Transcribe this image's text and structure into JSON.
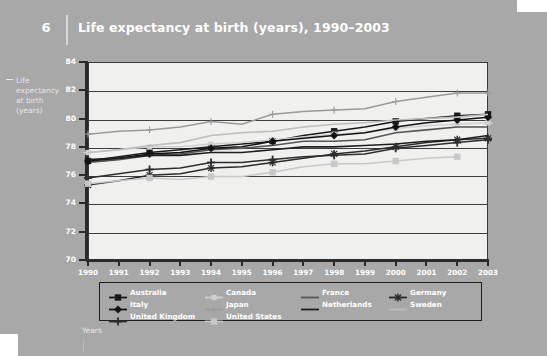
{
  "header": {
    "figure_number": "6",
    "title": "Life expectancy at birth (years), 1990–2003"
  },
  "axis_titles": {
    "y": "Life expectancy at birth (years)",
    "x": "Years"
  },
  "chart_data": {
    "type": "line",
    "title": "Life expectancy at birth (years), 1990–2003",
    "xlabel": "Years",
    "ylabel": "Life expectancy at birth (years)",
    "x": [
      1990,
      1991,
      1992,
      1993,
      1994,
      1995,
      1996,
      1997,
      1998,
      1999,
      2000,
      2001,
      2002,
      2003
    ],
    "categories": [
      "1990",
      "1991",
      "1992",
      "1993",
      "1994",
      "1995",
      "1996",
      "1997",
      "1998",
      "1999",
      "2000",
      "2001",
      "2002",
      "2003"
    ],
    "ylim": [
      70,
      84
    ],
    "yticks": [
      70,
      72,
      74,
      76,
      78,
      80,
      82,
      84
    ],
    "xlim": [
      1990,
      2003
    ],
    "grid": true,
    "legend_position": "bottom",
    "series": [
      {
        "name": "Australia",
        "color": "#1a1a1a",
        "marker": "square",
        "values": [
          77.0,
          77.3,
          77.6,
          77.8,
          78.0,
          78.2,
          78.4,
          78.8,
          79.1,
          79.4,
          79.8,
          80.0,
          80.2,
          80.3
        ]
      },
      {
        "name": "Canada",
        "color": "#d0d0d0",
        "marker": "cross-square",
        "values": [
          77.6,
          77.8,
          78.0,
          78.0,
          78.2,
          78.3,
          78.5,
          78.7,
          78.9,
          79.0,
          79.3,
          79.5,
          79.6,
          79.7
        ]
      },
      {
        "name": "France",
        "color": "#555555",
        "marker": "none",
        "values": [
          76.9,
          77.1,
          77.4,
          77.5,
          77.8,
          77.9,
          78.1,
          78.4,
          78.4,
          78.5,
          79.0,
          79.2,
          79.4,
          79.4
        ]
      },
      {
        "name": "Germany",
        "color": "#2b2b2b",
        "marker": "star",
        "values": [
          75.3,
          75.6,
          76.0,
          76.1,
          76.5,
          76.6,
          76.9,
          77.2,
          77.5,
          77.7,
          78.0,
          78.3,
          78.5,
          78.6
        ]
      },
      {
        "name": "Italy",
        "color": "#121212",
        "marker": "diamond",
        "values": [
          77.0,
          77.2,
          77.5,
          77.6,
          77.9,
          78.0,
          78.4,
          78.6,
          78.8,
          79.0,
          79.4,
          79.7,
          79.9,
          80.1
        ]
      },
      {
        "name": "Japan",
        "color": "#9a9a9a",
        "marker": "plus",
        "values": [
          78.9,
          79.1,
          79.2,
          79.4,
          79.8,
          79.6,
          80.3,
          80.5,
          80.6,
          80.7,
          81.2,
          81.5,
          81.8,
          81.8
        ]
      },
      {
        "name": "Netherlands",
        "color": "#1f1f1f",
        "marker": "none",
        "values": [
          77.1,
          77.2,
          77.4,
          77.4,
          77.6,
          77.6,
          77.8,
          78.0,
          78.0,
          78.1,
          78.2,
          78.4,
          78.5,
          78.8
        ]
      },
      {
        "name": "Sweden",
        "color": "#bdbdbd",
        "marker": "none",
        "values": [
          77.6,
          77.8,
          78.1,
          78.3,
          78.8,
          79.0,
          79.1,
          79.4,
          79.6,
          79.7,
          79.9,
          80.0,
          80.1,
          80.3
        ]
      },
      {
        "name": "United Kingdom",
        "color": "#2e2e2e",
        "marker": "plus-bold",
        "values": [
          75.8,
          76.1,
          76.4,
          76.5,
          76.9,
          76.9,
          77.1,
          77.3,
          77.4,
          77.5,
          77.9,
          78.1,
          78.3,
          78.5
        ]
      },
      {
        "name": "United States",
        "color": "#c8c8c8",
        "marker": "square-filled",
        "values": [
          75.4,
          75.6,
          75.8,
          75.7,
          75.9,
          75.9,
          76.2,
          76.6,
          76.8,
          76.8,
          77.0,
          77.2,
          77.3,
          null
        ]
      }
    ]
  },
  "legend": {
    "items": [
      {
        "label": "Australia"
      },
      {
        "label": "Canada"
      },
      {
        "label": "France"
      },
      {
        "label": "Germany"
      },
      {
        "label": "Italy"
      },
      {
        "label": "Japan"
      },
      {
        "label": "Netherlands"
      },
      {
        "label": "Sweden"
      },
      {
        "label": "United Kingdom"
      },
      {
        "label": "United States"
      }
    ]
  },
  "colors": {
    "page_background": "#a8a8a8",
    "plot_background": "#f0f0ee",
    "axis": "#2a2a2a",
    "text_light": "#ffffff"
  }
}
